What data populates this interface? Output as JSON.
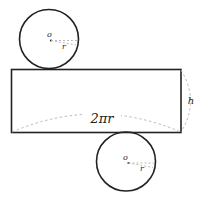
{
  "diagram": {
    "colors": {
      "stroke": "#222222",
      "dashed": "#bbbbbb",
      "background": "#ffffff"
    },
    "top_circle": {
      "center_label": "o",
      "radius_label": "r"
    },
    "rectangle": {
      "width_label": "2πr",
      "height_label": "h"
    },
    "bottom_circle": {
      "center_label": "o",
      "radius_label": "r"
    }
  }
}
